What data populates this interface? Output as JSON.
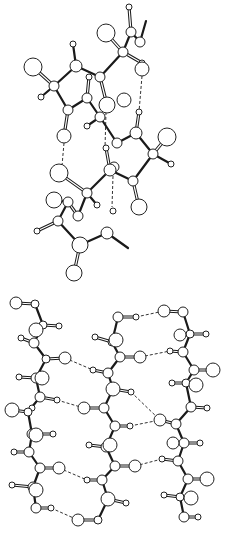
{
  "figure": {
    "colors": {
      "background": "#ffffff",
      "bond": "#1a1a1a",
      "atom_fill": "#ffffff",
      "atom_stroke": "#222222"
    }
  },
  "panels": [
    {
      "name": "alpha-helix",
      "atoms": [
        [
          129,
          7,
          3
        ],
        [
          131,
          32,
          5
        ],
        [
          106,
          33,
          9
        ],
        [
          140,
          42,
          5
        ],
        [
          123,
          52,
          5
        ],
        [
          142,
          63,
          3
        ],
        [
          142,
          69,
          7
        ],
        [
          100,
          77,
          5
        ],
        [
          76,
          66,
          6
        ],
        [
          73,
          44,
          3
        ],
        [
          33,
          67,
          9
        ],
        [
          54,
          86,
          5
        ],
        [
          41,
          97,
          3
        ],
        [
          89,
          77,
          3
        ],
        [
          87,
          98,
          5
        ],
        [
          68,
          110,
          5
        ],
        [
          107,
          105,
          8
        ],
        [
          124,
          100,
          7
        ],
        [
          100,
          117,
          5
        ],
        [
          87,
          126,
          3
        ],
        [
          139,
          112,
          3
        ],
        [
          136,
          133,
          6
        ],
        [
          64,
          136,
          7
        ],
        [
          117,
          143,
          5
        ],
        [
          167,
          137,
          9
        ],
        [
          153,
          154,
          5
        ],
        [
          171,
          164,
          3
        ],
        [
          106,
          148,
          3
        ],
        [
          110,
          170,
          6
        ],
        [
          59,
          173,
          9
        ],
        [
          114,
          167,
          5
        ],
        [
          133,
          181,
          5
        ],
        [
          87,
          193,
          5
        ],
        [
          97,
          205,
          3
        ],
        [
          54,
          200,
          8
        ],
        [
          68,
          202,
          5
        ],
        [
          78,
          216,
          5
        ],
        [
          113,
          211,
          3
        ],
        [
          139,
          207,
          8
        ],
        [
          58,
          221,
          5
        ],
        [
          37,
          231,
          3
        ],
        [
          107,
          233,
          6
        ],
        [
          80,
          245,
          8
        ],
        [
          74,
          273,
          8
        ]
      ],
      "bonds": [
        [
          131,
          32,
          140,
          42,
          1
        ],
        [
          140,
          42,
          146,
          21,
          1
        ],
        [
          131,
          32,
          129,
          7,
          2
        ],
        [
          131,
          32,
          123,
          52,
          1
        ],
        [
          123,
          52,
          106,
          33,
          2
        ],
        [
          123,
          52,
          142,
          63,
          2
        ],
        [
          123,
          52,
          100,
          77,
          1
        ],
        [
          100,
          77,
          76,
          66,
          1
        ],
        [
          76,
          66,
          73,
          44,
          1
        ],
        [
          76,
          66,
          54,
          86,
          1
        ],
        [
          54,
          86,
          33,
          67,
          2
        ],
        [
          54,
          86,
          41,
          97,
          1
        ],
        [
          54,
          86,
          68,
          110,
          1
        ],
        [
          68,
          110,
          87,
          98,
          1
        ],
        [
          87,
          98,
          89,
          77,
          2
        ],
        [
          87,
          98,
          100,
          117,
          1
        ],
        [
          100,
          77,
          107,
          105,
          2
        ],
        [
          100,
          117,
          87,
          126,
          1
        ],
        [
          100,
          117,
          117,
          143,
          1
        ],
        [
          68,
          110,
          64,
          136,
          2
        ],
        [
          117,
          143,
          136,
          133,
          1
        ],
        [
          136,
          133,
          139,
          112,
          2
        ],
        [
          136,
          133,
          153,
          154,
          1
        ],
        [
          153,
          154,
          167,
          137,
          2
        ],
        [
          153,
          154,
          171,
          164,
          1
        ],
        [
          153,
          154,
          133,
          181,
          1
        ],
        [
          133,
          181,
          139,
          207,
          2
        ],
        [
          133,
          181,
          110,
          170,
          1
        ],
        [
          110,
          170,
          106,
          148,
          2
        ],
        [
          110,
          170,
          87,
          193,
          1
        ],
        [
          87,
          193,
          97,
          205,
          1
        ],
        [
          87,
          193,
          78,
          216,
          1
        ],
        [
          87,
          193,
          59,
          173,
          2
        ],
        [
          68,
          202,
          78,
          216,
          2
        ],
        [
          68,
          202,
          58,
          221,
          1
        ],
        [
          58,
          221,
          37,
          231,
          2
        ],
        [
          58,
          221,
          80,
          245,
          1
        ],
        [
          80,
          245,
          107,
          233,
          1
        ],
        [
          107,
          233,
          128,
          248,
          1
        ],
        [
          80,
          245,
          74,
          273,
          2
        ],
        [
          68,
          202,
          54,
          200,
          1
        ]
      ],
      "hbonds": [
        [
          142,
          76,
          139,
          112
        ],
        [
          64,
          143,
          62,
          166
        ],
        [
          106,
          112,
          105,
          148
        ],
        [
          113,
          176,
          112,
          207
        ]
      ]
    },
    {
      "name": "beta-sheet",
      "atoms": [
        [
          16,
          303,
          6
        ],
        [
          35,
          304,
          4
        ],
        [
          36,
          330,
          7
        ],
        [
          43,
          325,
          4
        ],
        [
          59,
          326,
          3
        ],
        [
          34,
          343,
          5
        ],
        [
          21,
          338,
          3
        ],
        [
          46,
          359,
          4
        ],
        [
          65,
          358,
          6
        ],
        [
          42,
          378,
          7
        ],
        [
          36,
          378,
          5
        ],
        [
          19,
          377,
          3
        ],
        [
          40,
          397,
          5
        ],
        [
          57,
          400,
          3
        ],
        [
          32,
          408,
          3
        ],
        [
          12,
          410,
          7
        ],
        [
          28,
          412,
          4
        ],
        [
          32,
          434,
          5
        ],
        [
          36,
          435,
          7
        ],
        [
          53,
          434,
          3
        ],
        [
          29,
          452,
          5
        ],
        [
          14,
          452,
          3
        ],
        [
          40,
          468,
          5
        ],
        [
          59,
          468,
          6
        ],
        [
          36,
          490,
          7
        ],
        [
          33,
          487,
          5
        ],
        [
          12,
          485,
          3
        ],
        [
          36,
          508,
          5
        ],
        [
          51,
          508,
          3
        ],
        [
          78,
          520,
          6
        ],
        [
          98,
          520,
          4
        ],
        [
          118,
          317,
          5
        ],
        [
          136,
          317,
          3
        ],
        [
          112,
          342,
          4
        ],
        [
          116,
          340,
          7
        ],
        [
          95,
          337,
          3
        ],
        [
          120,
          357,
          5
        ],
        [
          140,
          357,
          6
        ],
        [
          108,
          373,
          5
        ],
        [
          93,
          370,
          3
        ],
        [
          113,
          389,
          7
        ],
        [
          131,
          392,
          3
        ],
        [
          84,
          408,
          6
        ],
        [
          104,
          408,
          5
        ],
        [
          115,
          426,
          5
        ],
        [
          130,
          426,
          3
        ],
        [
          106,
          447,
          5
        ],
        [
          110,
          445,
          7
        ],
        [
          89,
          445,
          3
        ],
        [
          115,
          466,
          5
        ],
        [
          135,
          466,
          6
        ],
        [
          102,
          480,
          5
        ],
        [
          87,
          480,
          3
        ],
        [
          108,
          499,
          7
        ],
        [
          126,
          503,
          3
        ],
        [
          164,
          311,
          6
        ],
        [
          183,
          312,
          5
        ],
        [
          190,
          334,
          4
        ],
        [
          180,
          335,
          6
        ],
        [
          206,
          334,
          3
        ],
        [
          170,
          351,
          3
        ],
        [
          183,
          352,
          5
        ],
        [
          194,
          370,
          5
        ],
        [
          213,
          370,
          7
        ],
        [
          186,
          383,
          4
        ],
        [
          172,
          383,
          3
        ],
        [
          196,
          385,
          7
        ],
        [
          191,
          407,
          5
        ],
        [
          207,
          408,
          3
        ],
        [
          160,
          420,
          6
        ],
        [
          176,
          424,
          5
        ],
        [
          173,
          443,
          6
        ],
        [
          184,
          443,
          5
        ],
        [
          200,
          443,
          3
        ],
        [
          162,
          459,
          3
        ],
        [
          178,
          461,
          5
        ],
        [
          188,
          479,
          5
        ],
        [
          207,
          479,
          7
        ],
        [
          164,
          495,
          3
        ],
        [
          180,
          497,
          4
        ],
        [
          191,
          498,
          7
        ],
        [
          184,
          517,
          5
        ],
        [
          198,
          517,
          3
        ]
      ],
      "chains": [
        [
          [
            35,
            304
          ],
          [
            43,
            325
          ],
          [
            34,
            343
          ],
          [
            46,
            359
          ],
          [
            36,
            378
          ],
          [
            40,
            397
          ],
          [
            28,
            412
          ],
          [
            32,
            434
          ],
          [
            29,
            452
          ],
          [
            40,
            468
          ],
          [
            33,
            487
          ],
          [
            36,
            508
          ]
        ],
        [
          [
            118,
            317
          ],
          [
            112,
            342
          ],
          [
            120,
            357
          ],
          [
            108,
            373
          ],
          [
            113,
            389
          ],
          [
            104,
            408
          ],
          [
            115,
            426
          ],
          [
            106,
            447
          ],
          [
            115,
            466
          ],
          [
            102,
            480
          ],
          [
            108,
            499
          ],
          [
            98,
            520
          ]
        ],
        [
          [
            183,
            312
          ],
          [
            190,
            334
          ],
          [
            183,
            352
          ],
          [
            194,
            370
          ],
          [
            186,
            383
          ],
          [
            191,
            407
          ],
          [
            176,
            424
          ],
          [
            184,
            443
          ],
          [
            178,
            461
          ],
          [
            188,
            479
          ],
          [
            180,
            497
          ],
          [
            184,
            517
          ]
        ]
      ],
      "side_bonds": [
        [
          16,
          303,
          35,
          304
        ],
        [
          43,
          325,
          59,
          326
        ],
        [
          34,
          343,
          21,
          338
        ],
        [
          46,
          359,
          65,
          358
        ],
        [
          36,
          378,
          19,
          377
        ],
        [
          40,
          397,
          57,
          400
        ],
        [
          28,
          412,
          12,
          410
        ],
        [
          32,
          434,
          53,
          434
        ],
        [
          29,
          452,
          14,
          452
        ],
        [
          40,
          468,
          59,
          468
        ],
        [
          33,
          487,
          12,
          485
        ],
        [
          36,
          508,
          51,
          508
        ],
        [
          118,
          317,
          136,
          317
        ],
        [
          112,
          342,
          95,
          337
        ],
        [
          120,
          357,
          140,
          357
        ],
        [
          108,
          373,
          93,
          370
        ],
        [
          113,
          389,
          131,
          392
        ],
        [
          104,
          408,
          84,
          408
        ],
        [
          115,
          426,
          130,
          426
        ],
        [
          106,
          447,
          89,
          445
        ],
        [
          115,
          466,
          135,
          466
        ],
        [
          102,
          480,
          87,
          480
        ],
        [
          108,
          499,
          126,
          503
        ],
        [
          98,
          520,
          78,
          520
        ],
        [
          183,
          312,
          164,
          311
        ],
        [
          190,
          334,
          206,
          334
        ],
        [
          183,
          352,
          170,
          351
        ],
        [
          194,
          370,
          213,
          370
        ],
        [
          186,
          383,
          172,
          383
        ],
        [
          191,
          407,
          207,
          408
        ],
        [
          176,
          424,
          160,
          420
        ],
        [
          184,
          443,
          200,
          443
        ],
        [
          178,
          461,
          162,
          459
        ],
        [
          188,
          479,
          207,
          479
        ],
        [
          180,
          497,
          164,
          495
        ],
        [
          184,
          517,
          198,
          517
        ]
      ],
      "hbonds": [
        [
          65,
          358,
          93,
          370
        ],
        [
          57,
          400,
          84,
          408
        ],
        [
          59,
          468,
          87,
          480
        ],
        [
          51,
          508,
          78,
          520
        ],
        [
          136,
          317,
          164,
          311
        ],
        [
          140,
          357,
          170,
          351
        ],
        [
          131,
          392,
          160,
          420
        ],
        [
          130,
          426,
          160,
          420
        ],
        [
          135,
          466,
          162,
          459
        ]
      ]
    }
  ]
}
